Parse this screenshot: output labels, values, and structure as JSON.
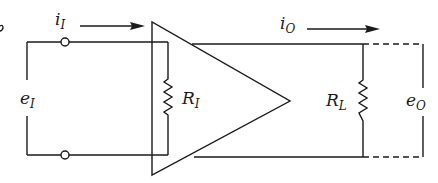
{
  "diagram": {
    "type": "amplifier-equivalent-circuit",
    "labels": {
      "input_current": {
        "main": "i",
        "sub": "I"
      },
      "output_current": {
        "main": "i",
        "sub": "O"
      },
      "input_voltage": {
        "main": "e",
        "sub": "I"
      },
      "output_voltage": {
        "main": "e",
        "sub": "O"
      },
      "input_resistance": {
        "main": "R",
        "sub": "I"
      },
      "load_resistance": {
        "main": "R",
        "sub": "L"
      }
    },
    "colors": {
      "stroke": "#1a1a1a",
      "background": "#ffffff"
    }
  }
}
